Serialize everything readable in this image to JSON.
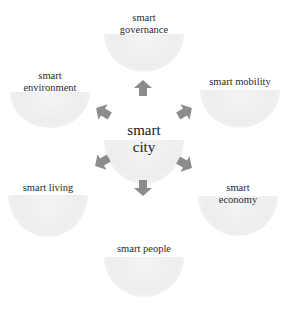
{
  "diagram": {
    "type": "hub-and-spoke",
    "center": {
      "label_line1": "smart",
      "label_line2": "city"
    },
    "nodes": [
      {
        "id": "governance",
        "line1": "smart",
        "line2": "governance"
      },
      {
        "id": "mobility",
        "line1": "smart mobility",
        "line2": ""
      },
      {
        "id": "economy",
        "line1": "smart",
        "line2": "economy"
      },
      {
        "id": "people",
        "line1": "smart people",
        "line2": ""
      },
      {
        "id": "living",
        "line1": "smart living",
        "line2": ""
      },
      {
        "id": "environment",
        "line1": "smart",
        "line2": "environment"
      }
    ],
    "colors": {
      "arrow": "#8c8c8c",
      "bowl": "#ececec",
      "text": "#2a2a2a",
      "background": "#ffffff"
    }
  }
}
